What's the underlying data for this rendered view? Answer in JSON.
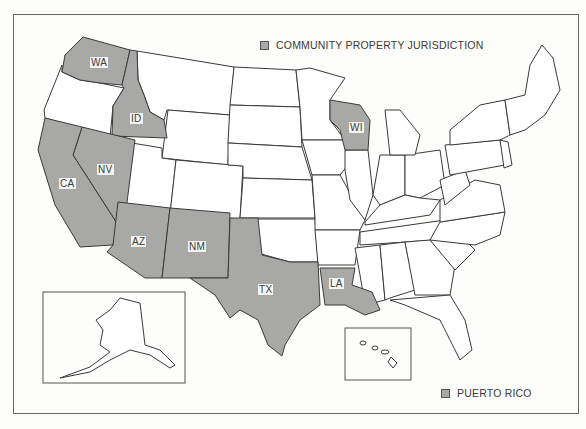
{
  "legend": {
    "community_property": "COMMUNITY PROPERTY JURISDICTION",
    "puerto_rico": "PUERTO RICO"
  },
  "colors": {
    "community_fill": "#a8a8a6",
    "other_fill": "#ffffff",
    "border": "#3a3a3a",
    "frame": "#6a6a6a"
  },
  "states": {
    "WA": "WA",
    "ID": "ID",
    "NV": "NV",
    "CA": "CA",
    "AZ": "AZ",
    "NM": "NM",
    "TX": "TX",
    "LA": "LA",
    "WI": "WI"
  },
  "community_property_states": [
    "WA",
    "ID",
    "NV",
    "CA",
    "AZ",
    "NM",
    "TX",
    "LA",
    "WI"
  ],
  "insets": [
    "Alaska",
    "Hawaii"
  ]
}
